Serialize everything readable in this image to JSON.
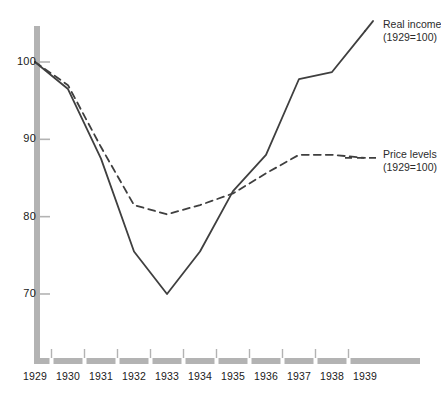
{
  "chart_data": {
    "type": "line",
    "title": "",
    "subtitle": "",
    "xlabel": "",
    "ylabel": "",
    "categories": [
      "1929",
      "1930",
      "1931",
      "1932",
      "1933",
      "1934",
      "1935",
      "1936",
      "1937",
      "1938",
      "1939"
    ],
    "x": [
      1929,
      1930,
      1931,
      1932,
      1933,
      1934,
      1935,
      1936,
      1937,
      1938,
      1939
    ],
    "xlim": [
      1929,
      1939
    ],
    "ylim": [
      65,
      106
    ],
    "yticks": [
      70,
      80,
      90,
      100
    ],
    "ytick_labels": [
      "70",
      "80",
      "90",
      "100"
    ],
    "grid": false,
    "legend_position": "right-inline",
    "series": [
      {
        "name": "Real income (1929=100)",
        "label_line1": "Real income",
        "label_line2": "(1929=100)",
        "style": "solid",
        "color": "#3f3f3f",
        "values": [
          100,
          96.5,
          87.5,
          75.5,
          70,
          75.5,
          83.3,
          88,
          97.8,
          98.7,
          104
        ]
      },
      {
        "name": "Price levels (1929=100)",
        "label_line1": "Price levels",
        "label_line2": "(1929=100)",
        "style": "dashed",
        "color": "#3f3f3f",
        "values": [
          100,
          97,
          89,
          81.5,
          80.3,
          81.5,
          83,
          85.6,
          88,
          88,
          87.6
        ]
      }
    ],
    "axis_color": "#b3b3b3",
    "tick_color": "#b3b3b3"
  },
  "axes": {
    "y_tick_labels": [
      "100",
      "90",
      "80",
      "70"
    ],
    "x_tick_labels": [
      "1929",
      "1930",
      "1931",
      "1932",
      "1933",
      "1934",
      "1935",
      "1936",
      "1937",
      "1938",
      "1939"
    ]
  },
  "legend": {
    "real_income": {
      "line1": "Real income",
      "line2": "(1929=100)"
    },
    "price_levels": {
      "line1": "Price levels",
      "line2": "(1929=100)"
    }
  }
}
